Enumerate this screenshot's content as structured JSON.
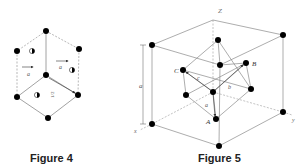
{
  "figure4": {
    "caption": "Figure 4",
    "labels": {
      "a_left": "a",
      "a_right": "a",
      "half": "1/2"
    }
  },
  "figure5": {
    "caption": "Figure 5",
    "labels": {
      "z_axis": "Z",
      "x_axis": "x",
      "y_axis": "y",
      "edge": "a",
      "A": "A",
      "B": "B",
      "C": "C",
      "vec_a": "a",
      "vec_b": "b",
      "vec_c": "c"
    }
  },
  "colors": {
    "line": "#8a8a8a",
    "atom": "#000000",
    "dashed": "#9a9a9a"
  }
}
